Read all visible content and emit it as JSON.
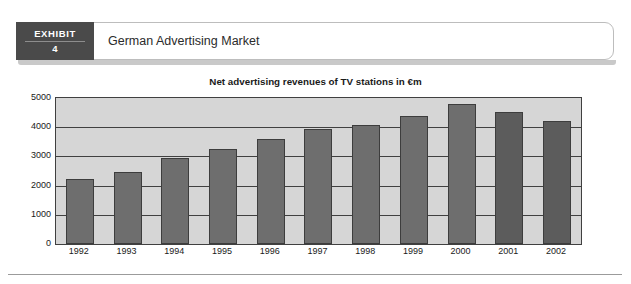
{
  "exhibit": {
    "badge_word": "EXHIBIT",
    "badge_number": "4",
    "title": "German Advertising Market"
  },
  "chart_data": {
    "type": "bar",
    "title": "Net advertising revenues of TV stations in €m",
    "xlabel": "",
    "ylabel": "",
    "categories": [
      "1992",
      "1993",
      "1994",
      "1995",
      "1996",
      "1997",
      "1998",
      "1999",
      "2000",
      "2001",
      "2002"
    ],
    "values": [
      2240,
      2480,
      2940,
      3250,
      3580,
      3930,
      4080,
      4400,
      4780,
      4520,
      4200
    ],
    "ylim": [
      0,
      5000
    ],
    "yticks": [
      0,
      1000,
      2000,
      3000,
      4000,
      5000
    ],
    "ytick_labels": [
      "0",
      "1000",
      "2000",
      "3000",
      "4000",
      "5000"
    ],
    "grid": true,
    "legend": "none",
    "bar_color": "#6e6e6e",
    "bar_color_highlight": "#5c5c5c",
    "highlight_categories": [
      "2001",
      "2002"
    ],
    "plot_background": "#d6d6d6",
    "axis_color": "#404040"
  }
}
